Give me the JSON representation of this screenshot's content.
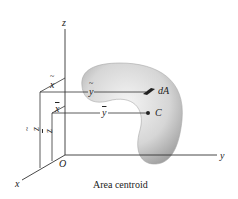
{
  "figure": {
    "caption": "Area centroid",
    "axes": {
      "x": "x",
      "y": "y",
      "z": "z",
      "origin": "O"
    },
    "labels": {
      "element": "dA",
      "centroid": "C",
      "x_tilde": "x",
      "y_tilde": "y",
      "z_tilde": "z",
      "x_bar": "x",
      "y_bar": "y",
      "z_bar": "z"
    },
    "colors": {
      "line": "#333333",
      "shape_fill": "#c8c8c8",
      "shape_edge": "#9a9a9a",
      "background": "#ffffff"
    }
  }
}
